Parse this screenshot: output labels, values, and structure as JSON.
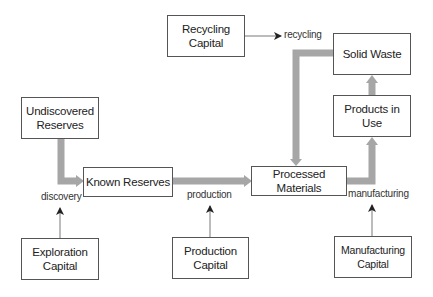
{
  "diagram": {
    "type": "flow",
    "nodes": {
      "recycling_capital": "Recycling\nCapital",
      "solid_waste": "Solid Waste",
      "products_in_use": "Products in Use",
      "undiscovered_reserves": "Undiscovered\nReserves",
      "known_reserves": "Known Reserves",
      "processed_materials": "Processed Materials",
      "exploration_capital": "Exploration\nCapital",
      "production_capital": "Production\nCapital",
      "manufacturing_capital": "Manufacturing\nCapital"
    },
    "edge_labels": {
      "recycling": "recycling",
      "discovery": "discovery",
      "production": "production",
      "manufacturing": "manufacturing"
    },
    "edges": [
      {
        "from": "Undiscovered Reserves",
        "to": "Known Reserves",
        "label": "discovery",
        "style": "thick"
      },
      {
        "from": "Known Reserves",
        "to": "Processed Materials",
        "label": "production",
        "style": "thick"
      },
      {
        "from": "Processed Materials",
        "to": "Products in Use",
        "label": "manufacturing",
        "style": "thick"
      },
      {
        "from": "Products in Use",
        "to": "Solid Waste",
        "style": "thick"
      },
      {
        "from": "Solid Waste",
        "to": "Processed Materials",
        "label": "recycling",
        "style": "thick"
      },
      {
        "from": "Exploration Capital",
        "to": "discovery",
        "style": "thin"
      },
      {
        "from": "Production Capital",
        "to": "production",
        "style": "thin"
      },
      {
        "from": "Manufacturing Capital",
        "to": "manufacturing",
        "style": "thin"
      },
      {
        "from": "Recycling Capital",
        "to": "recycling",
        "style": "thin"
      }
    ],
    "colors": {
      "flow_arrow": "#a6a6a6",
      "box_border": "#555555",
      "thin_arrow": "#444444"
    }
  }
}
